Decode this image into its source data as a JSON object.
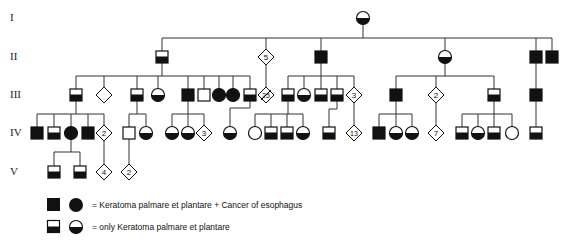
{
  "generations": [
    {
      "label": "I",
      "y": 18
    },
    {
      "label": "II",
      "y": 57
    },
    {
      "label": "III",
      "y": 95
    },
    {
      "label": "IV",
      "y": 133
    },
    {
      "label": "V",
      "y": 172
    }
  ],
  "colors": {
    "line": "#333333",
    "fill": "#111111",
    "background": "#ffffff"
  },
  "individuals": [
    {
      "id": "I-1",
      "shape": "circle",
      "status": "half",
      "x": 363,
      "y": 18
    },
    {
      "id": "II-1",
      "shape": "square",
      "status": "half",
      "x": 162,
      "y": 57
    },
    {
      "id": "II-2",
      "shape": "diamond",
      "status": "unknown",
      "x": 266,
      "y": 57,
      "count": "5"
    },
    {
      "id": "II-3",
      "shape": "square",
      "status": "full",
      "x": 321,
      "y": 57
    },
    {
      "id": "II-4",
      "shape": "circle",
      "status": "half",
      "x": 445,
      "y": 57
    },
    {
      "id": "II-5",
      "shape": "square",
      "status": "full",
      "x": 536,
      "y": 57
    },
    {
      "id": "II-6",
      "shape": "square",
      "status": "full",
      "x": 552,
      "y": 57
    },
    {
      "id": "III-1",
      "shape": "square",
      "status": "half",
      "x": 76,
      "y": 95
    },
    {
      "id": "III-2",
      "shape": "diamond",
      "status": "unknown",
      "x": 104,
      "y": 95
    },
    {
      "id": "III-3",
      "shape": "square",
      "status": "half",
      "x": 137,
      "y": 95
    },
    {
      "id": "III-4",
      "shape": "circle",
      "status": "half",
      "x": 158,
      "y": 95
    },
    {
      "id": "III-5",
      "shape": "square",
      "status": "full",
      "x": 188,
      "y": 95
    },
    {
      "id": "III-6",
      "shape": "square",
      "status": "unaffected",
      "x": 204,
      "y": 95
    },
    {
      "id": "III-7",
      "shape": "circle",
      "status": "full",
      "x": 219,
      "y": 95
    },
    {
      "id": "III-8",
      "shape": "circle",
      "status": "full",
      "x": 233,
      "y": 95
    },
    {
      "id": "III-9",
      "shape": "square",
      "status": "half",
      "x": 250,
      "y": 95
    },
    {
      "id": "III-10",
      "shape": "diamond",
      "status": "deceased",
      "x": 266,
      "y": 95,
      "count": "25"
    },
    {
      "id": "III-11",
      "shape": "square",
      "status": "half",
      "x": 288,
      "y": 95
    },
    {
      "id": "III-12",
      "shape": "circle",
      "status": "half",
      "x": 304,
      "y": 95
    },
    {
      "id": "III-13",
      "shape": "square",
      "status": "half",
      "x": 321,
      "y": 95
    },
    {
      "id": "III-14",
      "shape": "square",
      "status": "half",
      "x": 337,
      "y": 95
    },
    {
      "id": "III-15",
      "shape": "diamond",
      "status": "unknown",
      "x": 354,
      "y": 95,
      "count": "3"
    },
    {
      "id": "III-16",
      "shape": "square",
      "status": "full",
      "x": 396,
      "y": 95
    },
    {
      "id": "III-17",
      "shape": "diamond",
      "status": "unknown",
      "x": 436,
      "y": 95,
      "count": "2"
    },
    {
      "id": "III-18",
      "shape": "square",
      "status": "half",
      "x": 494,
      "y": 95
    },
    {
      "id": "III-19",
      "shape": "square",
      "status": "full",
      "x": 536,
      "y": 95
    },
    {
      "id": "IV-1",
      "shape": "square",
      "status": "full",
      "x": 37,
      "y": 133
    },
    {
      "id": "IV-2",
      "shape": "square",
      "status": "half",
      "x": 54,
      "y": 133
    },
    {
      "id": "IV-3",
      "shape": "circle",
      "status": "full",
      "x": 71,
      "y": 133
    },
    {
      "id": "IV-4",
      "shape": "square",
      "status": "full",
      "x": 88,
      "y": 133
    },
    {
      "id": "IV-5",
      "shape": "diamond",
      "status": "unknown",
      "x": 104,
      "y": 133,
      "count": "2"
    },
    {
      "id": "IV-6",
      "shape": "square",
      "status": "unaffected",
      "x": 129,
      "y": 133
    },
    {
      "id": "IV-7",
      "shape": "circle",
      "status": "half",
      "x": 146,
      "y": 133
    },
    {
      "id": "IV-8",
      "shape": "circle",
      "status": "half",
      "x": 172,
      "y": 133
    },
    {
      "id": "IV-9",
      "shape": "circle",
      "status": "half",
      "x": 188,
      "y": 133
    },
    {
      "id": "IV-10",
      "shape": "diamond",
      "status": "unknown",
      "x": 204,
      "y": 133,
      "count": "3"
    },
    {
      "id": "IV-11",
      "shape": "circle",
      "status": "half",
      "x": 230,
      "y": 133
    },
    {
      "id": "IV-12",
      "shape": "circle",
      "status": "unaffected",
      "x": 255,
      "y": 133
    },
    {
      "id": "IV-13",
      "shape": "square",
      "status": "half",
      "x": 271,
      "y": 133
    },
    {
      "id": "IV-14",
      "shape": "square",
      "status": "half",
      "x": 287,
      "y": 133
    },
    {
      "id": "IV-15",
      "shape": "circle",
      "status": "half",
      "x": 303,
      "y": 133
    },
    {
      "id": "IV-16",
      "shape": "square",
      "status": "half",
      "x": 329,
      "y": 133
    },
    {
      "id": "IV-17",
      "shape": "diamond",
      "status": "unknown",
      "x": 354,
      "y": 133,
      "count": "13"
    },
    {
      "id": "IV-18",
      "shape": "square",
      "status": "full",
      "x": 379,
      "y": 133
    },
    {
      "id": "IV-19",
      "shape": "circle",
      "status": "half",
      "x": 396,
      "y": 133
    },
    {
      "id": "IV-20",
      "shape": "circle",
      "status": "half",
      "x": 412,
      "y": 133
    },
    {
      "id": "IV-21",
      "shape": "diamond",
      "status": "unknown",
      "x": 436,
      "y": 133,
      "count": "7"
    },
    {
      "id": "IV-22",
      "shape": "square",
      "status": "half",
      "x": 462,
      "y": 133
    },
    {
      "id": "IV-23",
      "shape": "circle",
      "status": "half",
      "x": 478,
      "y": 133
    },
    {
      "id": "IV-24",
      "shape": "square",
      "status": "half",
      "x": 494,
      "y": 133
    },
    {
      "id": "IV-25",
      "shape": "circle",
      "status": "unaffected",
      "x": 512,
      "y": 133
    },
    {
      "id": "IV-26",
      "shape": "square",
      "status": "half",
      "x": 536,
      "y": 133
    },
    {
      "id": "V-1",
      "shape": "square",
      "status": "half",
      "x": 54,
      "y": 172
    },
    {
      "id": "V-2",
      "shape": "square",
      "status": "half",
      "x": 80,
      "y": 172
    },
    {
      "id": "V-3",
      "shape": "diamond",
      "status": "unknown",
      "x": 104,
      "y": 172,
      "count": "4"
    },
    {
      "id": "V-4",
      "shape": "diamond",
      "status": "unknown",
      "x": 129,
      "y": 172,
      "count": "2"
    }
  ],
  "lines": [
    [
      162,
      38,
      552,
      38
    ],
    [
      363,
      24,
      363,
      38
    ],
    [
      162,
      38,
      162,
      51
    ],
    [
      266,
      38,
      266,
      51
    ],
    [
      321,
      38,
      321,
      51
    ],
    [
      445,
      38,
      445,
      51
    ],
    [
      536,
      38,
      536,
      51
    ],
    [
      552,
      38,
      552,
      51
    ],
    [
      162,
      63,
      162,
      76
    ],
    [
      76,
      76,
      250,
      76
    ],
    [
      76,
      76,
      76,
      89
    ],
    [
      104,
      76,
      104,
      89
    ],
    [
      137,
      76,
      137,
      89
    ],
    [
      158,
      76,
      158,
      89
    ],
    [
      188,
      76,
      188,
      89
    ],
    [
      204,
      76,
      204,
      89
    ],
    [
      219,
      76,
      219,
      89
    ],
    [
      233,
      76,
      233,
      89
    ],
    [
      250,
      76,
      250,
      89
    ],
    [
      266,
      64,
      266,
      88
    ],
    [
      321,
      63,
      321,
      76
    ],
    [
      288,
      76,
      354,
      76
    ],
    [
      288,
      76,
      288,
      89
    ],
    [
      304,
      76,
      304,
      89
    ],
    [
      321,
      76,
      321,
      89
    ],
    [
      337,
      76,
      337,
      89
    ],
    [
      354,
      76,
      354,
      88
    ],
    [
      445,
      63,
      445,
      76
    ],
    [
      396,
      76,
      494,
      76
    ],
    [
      396,
      76,
      396,
      89
    ],
    [
      436,
      76,
      436,
      88
    ],
    [
      494,
      76,
      494,
      89
    ],
    [
      536,
      63,
      536,
      89
    ],
    [
      76,
      101,
      76,
      114
    ],
    [
      37,
      114,
      104,
      114
    ],
    [
      37,
      114,
      37,
      127
    ],
    [
      54,
      114,
      54,
      127
    ],
    [
      71,
      114,
      71,
      127
    ],
    [
      88,
      114,
      88,
      127
    ],
    [
      104,
      114,
      104,
      126
    ],
    [
      137,
      101,
      137,
      114
    ],
    [
      129,
      114,
      146,
      114
    ],
    [
      129,
      114,
      129,
      127
    ],
    [
      146,
      114,
      146,
      127
    ],
    [
      188,
      101,
      188,
      114
    ],
    [
      172,
      114,
      204,
      114
    ],
    [
      172,
      114,
      172,
      127
    ],
    [
      188,
      114,
      188,
      127
    ],
    [
      204,
      114,
      204,
      126
    ],
    [
      250,
      101,
      250,
      108
    ],
    [
      230,
      108,
      250,
      108
    ],
    [
      230,
      108,
      230,
      127
    ],
    [
      288,
      101,
      288,
      114
    ],
    [
      255,
      114,
      303,
      114
    ],
    [
      255,
      114,
      255,
      127
    ],
    [
      271,
      114,
      271,
      127
    ],
    [
      287,
      114,
      287,
      127
    ],
    [
      303,
      114,
      303,
      127
    ],
    [
      337,
      101,
      337,
      109
    ],
    [
      329,
      109,
      337,
      109
    ],
    [
      329,
      109,
      329,
      127
    ],
    [
      354,
      102,
      354,
      126
    ],
    [
      396,
      101,
      396,
      114
    ],
    [
      379,
      114,
      412,
      114
    ],
    [
      379,
      114,
      379,
      127
    ],
    [
      396,
      114,
      396,
      127
    ],
    [
      412,
      114,
      412,
      127
    ],
    [
      436,
      102,
      436,
      126
    ],
    [
      494,
      101,
      494,
      114
    ],
    [
      462,
      114,
      512,
      114
    ],
    [
      462,
      114,
      462,
      127
    ],
    [
      478,
      114,
      478,
      127
    ],
    [
      494,
      114,
      494,
      127
    ],
    [
      512,
      114,
      512,
      127
    ],
    [
      536,
      101,
      536,
      127
    ],
    [
      71,
      139,
      71,
      152
    ],
    [
      54,
      152,
      80,
      152
    ],
    [
      54,
      152,
      54,
      166
    ],
    [
      80,
      152,
      80,
      166
    ],
    [
      104,
      140,
      104,
      165
    ],
    [
      129,
      139,
      129,
      165
    ]
  ],
  "legend": [
    {
      "symbols": [
        "square-full",
        "circle-full"
      ],
      "text": "= Keratoma  palmare et  plantare  + Cancer of esophagus",
      "y": 205
    },
    {
      "symbols": [
        "square-half",
        "circle-half"
      ],
      "text": "= only  Keratoma  palmare  et  plantare",
      "y": 227
    }
  ]
}
